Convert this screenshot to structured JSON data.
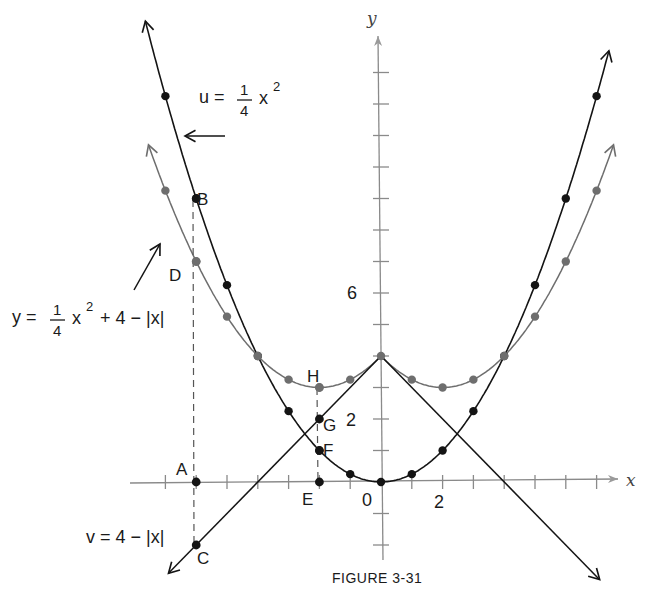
{
  "figure": {
    "caption": "FIGURE 3-31",
    "axis_x_label": "x",
    "axis_y_label": "y",
    "tick_labels": {
      "origin": "0",
      "x_two": "2",
      "y_two": "2",
      "y_six": "6"
    },
    "colors": {
      "black_curve": "#141414",
      "gray_curve": "#6e6e6e",
      "axis": "#8a8a8a",
      "background": "#ffffff"
    }
  },
  "equations": {
    "u": {
      "lhs": "u =",
      "num": "1",
      "den": "4",
      "var": "x",
      "exp": "2"
    },
    "y": {
      "lhs": "y =",
      "num": "1",
      "den": "4",
      "var": "x",
      "exp": "2",
      "rest": "+ 4 − |x|"
    },
    "v": {
      "text": "v = 4 − |x|"
    }
  },
  "points": {
    "A": "A",
    "B": "B",
    "C": "C",
    "D": "D",
    "E": "E",
    "F": "F",
    "G": "G",
    "H": "H"
  },
  "chart_data": {
    "type": "line",
    "title": "FIGURE 3-31",
    "xlabel": "x",
    "ylabel": "y",
    "xlim": [
      -7.5,
      7.5
    ],
    "ylim": [
      -3,
      13
    ],
    "grid": false,
    "tick_step": 1,
    "labeled_ticks": {
      "x": [
        0,
        2
      ],
      "y": [
        2,
        6
      ]
    },
    "series": [
      {
        "name": "u = 1/4 x^2",
        "color": "#141414",
        "x": [
          -7,
          -6,
          -5,
          -4,
          -3,
          -2,
          -1,
          0,
          1,
          2,
          3,
          4,
          5,
          6,
          7
        ],
        "values": [
          12.25,
          9,
          6.25,
          4,
          2.25,
          1,
          0.25,
          0,
          0.25,
          1,
          2.25,
          4,
          6.25,
          9,
          12.25
        ]
      },
      {
        "name": "v = 4 - |x|",
        "color": "#141414",
        "x": [
          -7,
          0,
          7
        ],
        "values": [
          -3,
          4,
          -3
        ]
      },
      {
        "name": "y = 1/4 x^2 + 4 - |x|",
        "color": "#6e6e6e",
        "x": [
          -7,
          -6,
          -5,
          -4,
          -3,
          -2,
          -1,
          0,
          1,
          2,
          3,
          4,
          5,
          6,
          7
        ],
        "values": [
          9.25,
          7,
          5.25,
          4,
          3.25,
          3,
          3.25,
          4,
          3.25,
          3,
          3.25,
          4,
          5.25,
          7,
          9.25
        ]
      }
    ],
    "annotations": [
      {
        "label": "A",
        "x": -6,
        "y": 0
      },
      {
        "label": "B",
        "x": -6,
        "y": 9
      },
      {
        "label": "C",
        "x": -6,
        "y": -2
      },
      {
        "label": "D",
        "x": -6,
        "y": 7
      },
      {
        "label": "E",
        "x": -2,
        "y": 0
      },
      {
        "label": "F",
        "x": -2,
        "y": 1
      },
      {
        "label": "G",
        "x": -2,
        "y": 2
      },
      {
        "label": "H",
        "x": -2,
        "y": 3
      }
    ]
  }
}
